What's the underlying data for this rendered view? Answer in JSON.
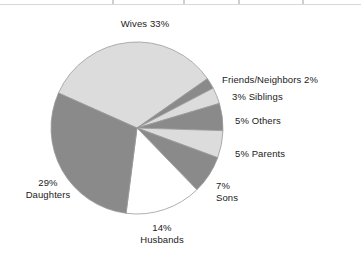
{
  "figure": {
    "name": "caregiver-relationship-pie-chart",
    "background": "#ffffff"
  },
  "scan_artifacts": {
    "rule_color": "#d8d8d8",
    "tick_color": "#cfcfcf"
  },
  "palette": {
    "light_gray": "#dcdcdc",
    "dark_gray": "#8a8a8a",
    "white": "#ffffff",
    "outline": "#9a9a9a",
    "text": "#1a1a1a"
  },
  "geometry": {
    "center_x": 137,
    "center_y": 128,
    "radius": 86
  },
  "chart_data": {
    "type": "pie",
    "title": "",
    "subtitle": "",
    "xlabel": "",
    "ylabel": "",
    "legend_position": "none",
    "grid": false,
    "units": "percent",
    "total": 98,
    "categories": [
      "Wives",
      "Friends/Neighbors",
      "Siblings",
      "Others",
      "Parents",
      "Sons",
      "Husbands",
      "Daughters"
    ],
    "values": [
      33,
      2,
      3,
      5,
      5,
      7,
      14,
      29
    ],
    "slices": [
      {
        "name": "Wives",
        "value": 33,
        "label": "Wives 33%",
        "fill": "#dcdcdc",
        "start_angle": 294.0,
        "end_angle": 55.0
      },
      {
        "name": "Friends/Neighbors",
        "value": 2,
        "label": "Friends/Neighbors 2%",
        "fill": "#8a8a8a",
        "start_angle": 55.0,
        "end_angle": 62.4
      },
      {
        "name": "Siblings",
        "value": 3,
        "label": "3% Siblings",
        "fill": "#dcdcdc",
        "start_angle": 62.4,
        "end_angle": 73.4
      },
      {
        "name": "Others",
        "value": 5,
        "label": "5% Others",
        "fill": "#8a8a8a",
        "start_angle": 73.4,
        "end_angle": 91.8
      },
      {
        "name": "Parents",
        "value": 5,
        "label": "5% Parents",
        "fill": "#dcdcdc",
        "start_angle": 91.8,
        "end_angle": 110.2
      },
      {
        "name": "Sons",
        "value": 7,
        "label": "7% Sons",
        "fill": "#8a8a8a",
        "start_angle": 110.2,
        "end_angle": 135.9
      },
      {
        "name": "Husbands",
        "value": 14,
        "label": "14% Husbands",
        "fill": "#ffffff",
        "start_angle": 135.9,
        "end_angle": 187.3
      },
      {
        "name": "Daughters",
        "value": 29,
        "label": "29% Daughters",
        "fill": "#8a8a8a",
        "start_angle": 187.3,
        "end_angle": 294.0
      }
    ],
    "annotations": [
      {
        "id": "wives",
        "line1": "Wives 33%",
        "line2": "",
        "align": "center",
        "x": 145,
        "y": 18
      },
      {
        "id": "friends",
        "line1": "Friends/Neighbors 2%",
        "line2": "",
        "align": "left",
        "x": 222,
        "y": 74
      },
      {
        "id": "siblings",
        "line1": "3% Siblings",
        "line2": "",
        "align": "left",
        "x": 232,
        "y": 91
      },
      {
        "id": "others",
        "line1": "5% Others",
        "line2": "",
        "align": "left",
        "x": 235,
        "y": 115
      },
      {
        "id": "parents",
        "line1": "5% Parents",
        "line2": "",
        "align": "left",
        "x": 235,
        "y": 148
      },
      {
        "id": "sons",
        "line1": "7%",
        "line2": "Sons",
        "align": "left",
        "x": 216,
        "y": 180
      },
      {
        "id": "husbands",
        "line1": "14%",
        "line2": "Husbands",
        "align": "center",
        "x": 162,
        "y": 222
      },
      {
        "id": "daughters",
        "line1": "29%",
        "line2": "Daughters",
        "align": "center",
        "x": 48,
        "y": 177
      }
    ]
  }
}
